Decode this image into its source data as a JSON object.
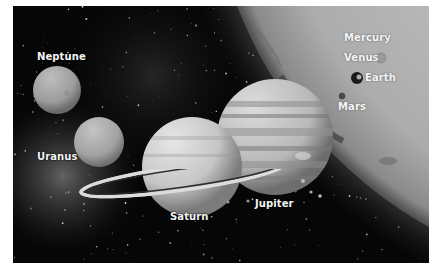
{
  "image": {
    "title": "Planets of the Solar System compared with the Sun",
    "style": "grayscale",
    "labels": {
      "mercury": "Mercury",
      "venus": "Venus",
      "earth": "Earth",
      "mars": "Mars",
      "jupiter": "Jupiter",
      "saturn": "Saturn",
      "uranus": "Uranus",
      "neptune": "Neptune"
    }
  },
  "colors": {
    "space": "#060606",
    "sun": "#a8a8a8",
    "label": "#f4f4f4",
    "page": "#ffffff"
  }
}
